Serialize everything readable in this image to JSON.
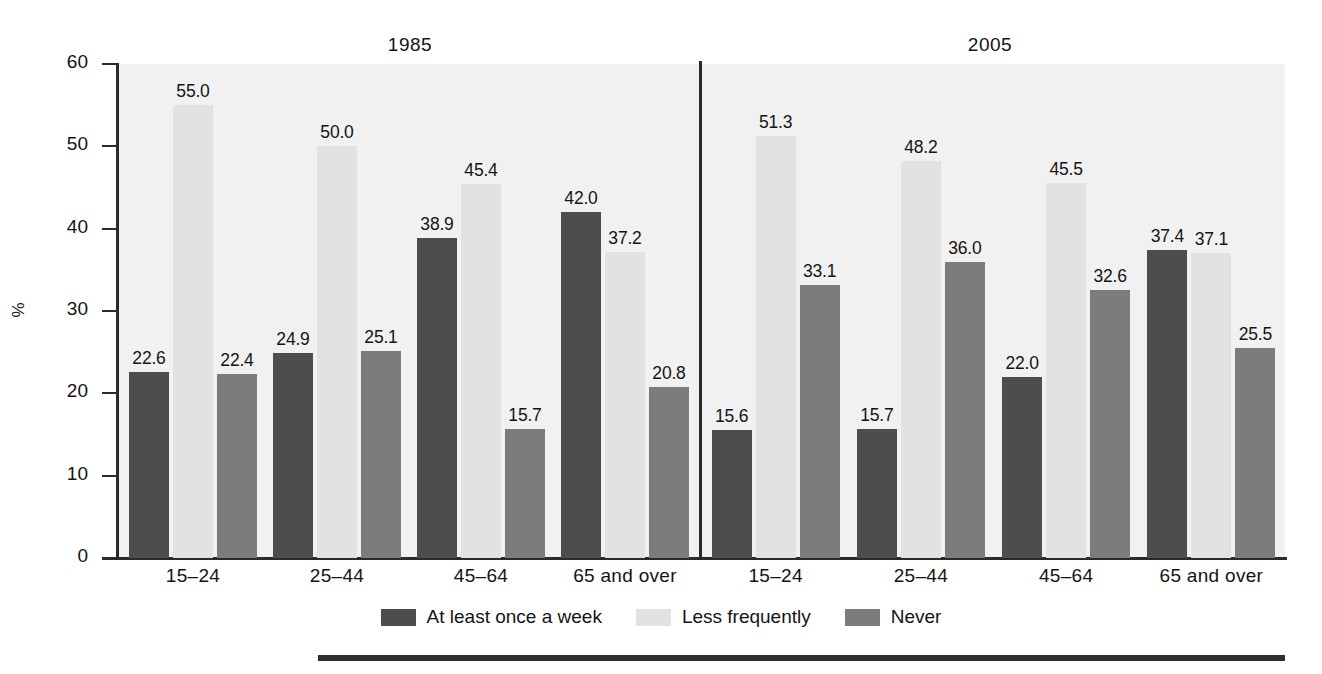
{
  "chart_data": {
    "type": "bar",
    "title": "",
    "xlabel": "",
    "ylabel": "%",
    "ylim": [
      0,
      60
    ],
    "yticks": [
      0,
      10,
      20,
      30,
      40,
      50,
      60
    ],
    "grid": false,
    "legend_position": "bottom-center",
    "panel_titles": [
      "1985",
      "2005"
    ],
    "categories": [
      "15–24",
      "25–44",
      "45–64",
      "65 and over"
    ],
    "series_names": [
      "At least once a week",
      "Less frequently",
      "Never"
    ],
    "series_colors": [
      "#4d4d4d",
      "#e2e2e2",
      "#7c7c7c"
    ],
    "panels": [
      {
        "name": "1985",
        "series": [
          {
            "name": "At least once a week",
            "values": [
              22.6,
              24.9,
              38.9,
              42.0
            ]
          },
          {
            "name": "Less frequently",
            "values": [
              55.0,
              50.0,
              45.4,
              37.2
            ]
          },
          {
            "name": "Never",
            "values": [
              22.4,
              25.1,
              15.7,
              20.8
            ]
          }
        ]
      },
      {
        "name": "2005",
        "series": [
          {
            "name": "At least once a week",
            "values": [
              15.6,
              15.7,
              22.0,
              37.4
            ]
          },
          {
            "name": "Less frequently",
            "values": [
              51.3,
              48.2,
              45.5,
              37.1
            ]
          },
          {
            "name": "Never",
            "values": [
              33.1,
              36.0,
              32.6,
              25.5
            ]
          }
        ]
      }
    ],
    "data_labels": [
      [
        "22.6",
        "55.0",
        "22.4",
        "24.9",
        "50.0",
        "25.1",
        "38.9",
        "45.4",
        "15.7",
        "42.0",
        "37.2",
        "20.8"
      ],
      [
        "15.6",
        "51.3",
        "33.1",
        "15.7",
        "48.2",
        "36.0",
        "22.0",
        "45.5",
        "32.6",
        "37.4",
        "37.1",
        "25.5"
      ]
    ]
  },
  "axis": {
    "y_title": "%",
    "y_tick_labels": [
      "60",
      "50",
      "40",
      "30",
      "20",
      "10",
      "0"
    ]
  },
  "panels": {
    "left_title": "1985",
    "right_title": "2005"
  },
  "categories": {
    "c0": "15–24",
    "c1": "25–44",
    "c2": "45–64",
    "c3": "65 and over"
  },
  "legend": {
    "items": [
      {
        "label": "At least once a week",
        "color": "#4d4d4d"
      },
      {
        "label": "Less frequently",
        "color": "#e2e2e2"
      },
      {
        "label": "Never",
        "color": "#7c7c7c"
      }
    ]
  }
}
